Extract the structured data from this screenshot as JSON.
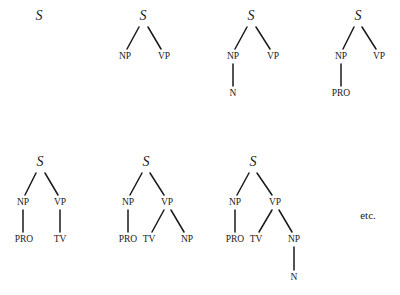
{
  "diagram": {
    "trees": [
      {
        "id": "tree-1",
        "nodes": [
          {
            "id": "S",
            "label": "S",
            "x": 39,
            "y": 17,
            "root": true
          }
        ],
        "edges": []
      },
      {
        "id": "tree-2",
        "nodes": [
          {
            "id": "S",
            "label": "S",
            "x": 143,
            "y": 17,
            "root": true
          },
          {
            "id": "NP",
            "label": "NP",
            "x": 125,
            "y": 57
          },
          {
            "id": "VP",
            "label": "VP",
            "x": 164,
            "y": 57
          }
        ],
        "edges": [
          {
            "from": [
              139,
              27
            ],
            "to": [
              127,
              49
            ]
          },
          {
            "from": [
              148,
              27
            ],
            "to": [
              161,
              49
            ]
          }
        ]
      },
      {
        "id": "tree-3",
        "nodes": [
          {
            "id": "S",
            "label": "S",
            "x": 251,
            "y": 17,
            "root": true
          },
          {
            "id": "NP",
            "label": "NP",
            "x": 233,
            "y": 57
          },
          {
            "id": "VP",
            "label": "VP",
            "x": 273,
            "y": 57
          },
          {
            "id": "N",
            "label": "N",
            "x": 233,
            "y": 94
          }
        ],
        "edges": [
          {
            "from": [
              247,
              27
            ],
            "to": [
              235,
              49
            ]
          },
          {
            "from": [
              256,
              27
            ],
            "to": [
              270,
              49
            ]
          },
          {
            "from": [
              233,
              64
            ],
            "to": [
              233,
              86
            ]
          }
        ]
      },
      {
        "id": "tree-4",
        "nodes": [
          {
            "id": "S",
            "label": "S",
            "x": 358,
            "y": 17,
            "root": true
          },
          {
            "id": "NP",
            "label": "NP",
            "x": 341,
            "y": 57
          },
          {
            "id": "VP",
            "label": "VP",
            "x": 379,
            "y": 57
          },
          {
            "id": "PRO",
            "label": "PRO",
            "x": 341,
            "y": 94
          }
        ],
        "edges": [
          {
            "from": [
              354,
              27
            ],
            "to": [
              343,
              49
            ]
          },
          {
            "from": [
              362,
              27
            ],
            "to": [
              376,
              49
            ]
          },
          {
            "from": [
              341,
              64
            ],
            "to": [
              341,
              86
            ]
          }
        ]
      },
      {
        "id": "tree-5",
        "nodes": [
          {
            "id": "S",
            "label": "S",
            "x": 40,
            "y": 163,
            "root": true
          },
          {
            "id": "NP",
            "label": "NP",
            "x": 23,
            "y": 203
          },
          {
            "id": "VP",
            "label": "VP",
            "x": 60,
            "y": 203
          },
          {
            "id": "PRO",
            "label": "PRO",
            "x": 24,
            "y": 240
          },
          {
            "id": "TV",
            "label": "TV",
            "x": 60,
            "y": 240
          }
        ],
        "edges": [
          {
            "from": [
              36,
              173
            ],
            "to": [
              25,
              195
            ]
          },
          {
            "from": [
              45,
              173
            ],
            "to": [
              58,
              195
            ]
          },
          {
            "from": [
              23,
              210
            ],
            "to": [
              23,
              232
            ]
          },
          {
            "from": [
              60,
              210
            ],
            "to": [
              60,
              232
            ]
          }
        ]
      },
      {
        "id": "tree-6",
        "nodes": [
          {
            "id": "S",
            "label": "S",
            "x": 146,
            "y": 163,
            "root": true
          },
          {
            "id": "NP",
            "label": "NP",
            "x": 128,
            "y": 203
          },
          {
            "id": "VP",
            "label": "VP",
            "x": 167,
            "y": 203
          },
          {
            "id": "PRO",
            "label": "PRO",
            "x": 128,
            "y": 240
          },
          {
            "id": "TV",
            "label": "TV",
            "x": 149,
            "y": 240
          },
          {
            "id": "NP2",
            "label": "NP",
            "x": 187,
            "y": 240
          }
        ],
        "edges": [
          {
            "from": [
              142,
              173
            ],
            "to": [
              130,
              195
            ]
          },
          {
            "from": [
              150,
              173
            ],
            "to": [
              164,
              195
            ]
          },
          {
            "from": [
              128,
              210
            ],
            "to": [
              128,
              232
            ]
          },
          {
            "from": [
              164,
              210
            ],
            "to": [
              152,
              232
            ]
          },
          {
            "from": [
              171,
              210
            ],
            "to": [
              184,
              232
            ]
          }
        ]
      },
      {
        "id": "tree-7",
        "nodes": [
          {
            "id": "S",
            "label": "S",
            "x": 253,
            "y": 163,
            "root": true
          },
          {
            "id": "NP",
            "label": "NP",
            "x": 235,
            "y": 203
          },
          {
            "id": "VP",
            "label": "VP",
            "x": 275,
            "y": 203
          },
          {
            "id": "PRO",
            "label": "PRO",
            "x": 235,
            "y": 240
          },
          {
            "id": "TV",
            "label": "TV",
            "x": 256,
            "y": 240
          },
          {
            "id": "NP2",
            "label": "NP",
            "x": 294,
            "y": 240
          },
          {
            "id": "N",
            "label": "N",
            "x": 294,
            "y": 278
          }
        ],
        "edges": [
          {
            "from": [
              249,
              173
            ],
            "to": [
              237,
              195
            ]
          },
          {
            "from": [
              257,
              173
            ],
            "to": [
              272,
              195
            ]
          },
          {
            "from": [
              235,
              210
            ],
            "to": [
              235,
              232
            ]
          },
          {
            "from": [
              272,
              210
            ],
            "to": [
              259,
              232
            ]
          },
          {
            "from": [
              279,
              210
            ],
            "to": [
              292,
              232
            ]
          },
          {
            "from": [
              294,
              247
            ],
            "to": [
              294,
              270
            ]
          }
        ]
      }
    ],
    "continuation": {
      "label": "etc.",
      "x": 368,
      "y": 216
    }
  }
}
